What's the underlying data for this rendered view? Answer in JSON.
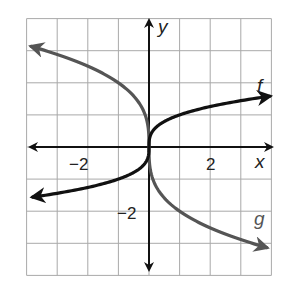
{
  "chart_data": {
    "type": "line",
    "title": "",
    "xlabel": "x",
    "ylabel": "y",
    "xlim": [
      -4,
      4
    ],
    "ylim": [
      -4,
      4
    ],
    "grid": true,
    "grid_step": 1,
    "x_tick_labels": [
      {
        "value": -2,
        "label": "−2"
      },
      {
        "value": 2,
        "label": "2"
      }
    ],
    "y_tick_labels": [
      {
        "value": -2,
        "label": "−2"
      }
    ],
    "legend": "curve labels placed at curve ends",
    "series": [
      {
        "name": "f",
        "label": "f",
        "color": "#111111",
        "approx_rule": "cube root of x (approx. shape)",
        "x": [
          -4,
          -3,
          -2,
          -1,
          -0.5,
          -0.1,
          0,
          0.1,
          0.5,
          1,
          2,
          3,
          4
        ],
        "y": [
          -1.59,
          -1.44,
          -1.26,
          -1.0,
          -0.79,
          -0.46,
          0,
          0.46,
          0.79,
          1.0,
          1.26,
          1.44,
          1.59
        ],
        "arrows": "both ends"
      },
      {
        "name": "g",
        "label": "g",
        "color": "#555555",
        "approx_rule": "negative two times cube root of x (approx. shape)",
        "x": [
          -4,
          -3,
          -2,
          -1,
          -0.5,
          -0.1,
          0,
          0.1,
          0.5,
          1,
          2,
          3,
          4
        ],
        "y": [
          3.17,
          2.88,
          2.52,
          2.0,
          1.59,
          0.93,
          0,
          -0.93,
          -1.59,
          -2.0,
          -2.52,
          -2.88,
          -3.17
        ],
        "arrows": "both ends"
      }
    ]
  },
  "labels": {
    "x_axis": "x",
    "y_axis": "y",
    "f": "f",
    "g": "g",
    "tick_x_neg2": "−2",
    "tick_x_2": "2",
    "tick_y_neg2": "−2"
  }
}
